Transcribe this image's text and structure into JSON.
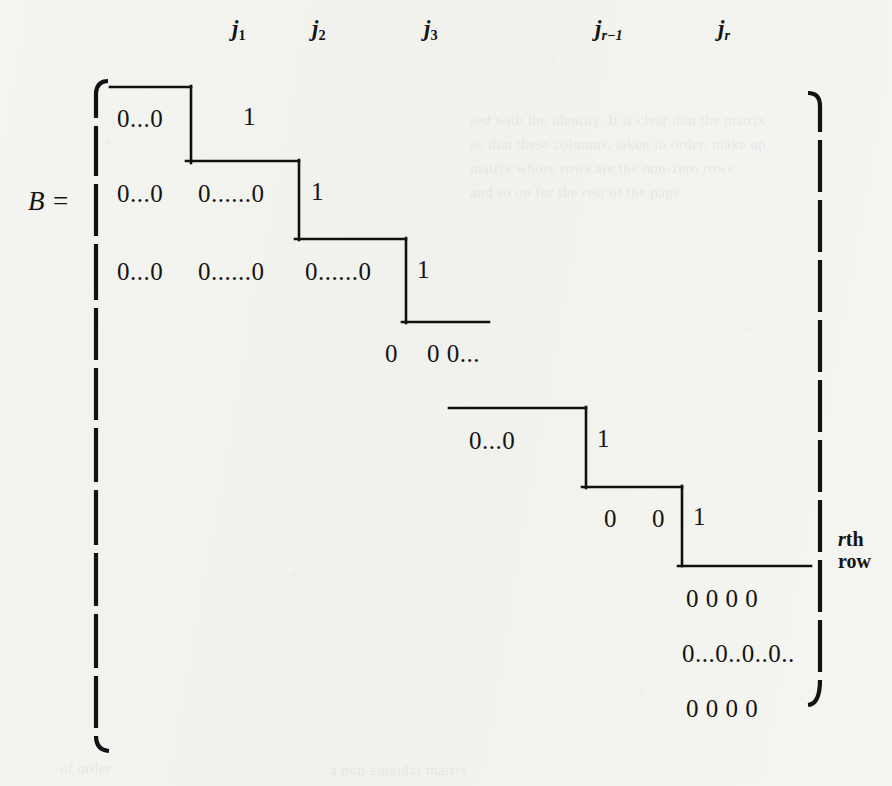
{
  "figure": {
    "matrix_name": "B =",
    "row_annotation": {
      "prefix": "r",
      "suffix": "th",
      "second_line": "row"
    },
    "column_labels": [
      {
        "name": "j1",
        "base": "j",
        "sub": "1",
        "x": 232,
        "y": 16
      },
      {
        "name": "j2",
        "base": "j",
        "sub": "2",
        "x": 312,
        "y": 16
      },
      {
        "name": "j3",
        "base": "j",
        "sub": "3",
        "x": 424,
        "y": 16
      },
      {
        "name": "jr-1",
        "base": "j",
        "sub": "r−1",
        "x": 595,
        "y": 16
      },
      {
        "name": "jr",
        "base": "j",
        "sub": "r",
        "x": 718,
        "y": 16
      }
    ],
    "entries": [
      {
        "name": "row1-zeros-1",
        "text": "0...0",
        "x": 117,
        "y": 105
      },
      {
        "name": "row1-one",
        "text": "1",
        "x": 243,
        "y": 103
      },
      {
        "name": "row2-zeros-1",
        "text": "0...0",
        "x": 117,
        "y": 180
      },
      {
        "name": "row2-zeros-2",
        "text": "0......0",
        "x": 198,
        "y": 180
      },
      {
        "name": "row2-one",
        "text": "1",
        "x": 311,
        "y": 178
      },
      {
        "name": "row3-zeros-1",
        "text": "0...0",
        "x": 117,
        "y": 258
      },
      {
        "name": "row3-zeros-2",
        "text": "0......0",
        "x": 198,
        "y": 258
      },
      {
        "name": "row3-zeros-3",
        "text": "0......0",
        "x": 305,
        "y": 258
      },
      {
        "name": "row3-one",
        "text": "1",
        "x": 417,
        "y": 256
      },
      {
        "name": "row4-zeros",
        "text": "0",
        "x": 385,
        "y": 340
      },
      {
        "name": "row4-zeros-b",
        "text": "0 0...",
        "x": 427,
        "y": 340
      },
      {
        "name": "row5-zeros",
        "text": "0...0",
        "x": 469,
        "y": 427
      },
      {
        "name": "row5-one",
        "text": "1",
        "x": 597,
        "y": 425
      },
      {
        "name": "row6-zero-1",
        "text": "0",
        "x": 604,
        "y": 505
      },
      {
        "name": "row6-zero-2",
        "text": "0",
        "x": 652,
        "y": 505
      },
      {
        "name": "row6-one",
        "text": "1",
        "x": 693,
        "y": 503
      },
      {
        "name": "tail-row1",
        "text": "0  0  0 0",
        "x": 686,
        "y": 585
      },
      {
        "name": "tail-row2",
        "text": "0...0..0..0..",
        "x": 682,
        "y": 640
      },
      {
        "name": "tail-row3",
        "text": "0  0  0 0",
        "x": 686,
        "y": 695
      }
    ],
    "staircase": {
      "name": "staircase-path",
      "color": "#111111",
      "segments": [
        {
          "x1": 110,
          "y1": 87,
          "x2": 191,
          "y2": 87
        },
        {
          "x1": 191,
          "y1": 87,
          "x2": 191,
          "y2": 162
        },
        {
          "x1": 186,
          "y1": 161,
          "x2": 299,
          "y2": 161
        },
        {
          "x1": 299,
          "y1": 161,
          "x2": 299,
          "y2": 239
        },
        {
          "x1": 295,
          "y1": 239,
          "x2": 406,
          "y2": 239
        },
        {
          "x1": 406,
          "y1": 239,
          "x2": 406,
          "y2": 322
        },
        {
          "x1": 402,
          "y1": 322,
          "x2": 489,
          "y2": 322
        },
        {
          "x1": 449,
          "y1": 408,
          "x2": 586,
          "y2": 408
        },
        {
          "x1": 586,
          "y1": 408,
          "x2": 586,
          "y2": 487
        },
        {
          "x1": 582,
          "y1": 487,
          "x2": 682,
          "y2": 487
        },
        {
          "x1": 682,
          "y1": 487,
          "x2": 682,
          "y2": 565
        },
        {
          "x1": 678,
          "y1": 566,
          "x2": 811,
          "y2": 566
        }
      ]
    },
    "brackets": {
      "left": {
        "name": "left-bracket",
        "x": 96,
        "top": 80,
        "bottom": 752
      },
      "right": {
        "name": "right-bracket",
        "x": 820,
        "top": 92,
        "bottom": 706
      }
    },
    "ghost_lines": [
      {
        "text": "sed with the identity. It is clear that the matrix",
        "x": 470,
        "y": 112
      },
      {
        "text": "so that these columns, taken in order, make up",
        "x": 470,
        "y": 136
      },
      {
        "text": "matrix whose rows are the non-zero rows",
        "x": 470,
        "y": 160
      },
      {
        "text": "and so on for the rest of the page",
        "x": 470,
        "y": 184
      },
      {
        "text": "of order",
        "x": 60,
        "y": 760
      },
      {
        "text": "a non-singular matrix",
        "x": 330,
        "y": 762
      }
    ]
  }
}
